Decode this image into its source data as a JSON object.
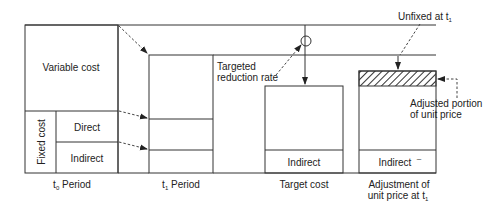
{
  "diagram": {
    "type": "target-costing-flow",
    "columns": [
      {
        "id": "t0",
        "label": "t",
        "sub": "0",
        "label_rest": " Period"
      },
      {
        "id": "t1",
        "label": "t",
        "sub": "1",
        "label_rest": " Period"
      },
      {
        "id": "target",
        "label": "Target cost"
      },
      {
        "id": "adjust",
        "label_line1": "Adjustment of",
        "label_line2": "unit price at t",
        "sub": "1"
      }
    ],
    "t0_box": {
      "variable_cost": "Variable cost",
      "fixed_cost": "Fixed cost",
      "direct": "Direct",
      "indirect": "Indirect"
    },
    "target_box": {
      "indirect": "Indirect"
    },
    "adjust_box": {
      "indirect": "Indirect",
      "mark": "–"
    },
    "annotations": {
      "targeted_reduction_line1": "Targeted",
      "targeted_reduction_line2": "reduction rate",
      "unfixed": "Unfixed at t",
      "unfixed_sub": "1",
      "adjusted_line1": "Adjusted portion",
      "adjusted_line2": "of unit price"
    }
  }
}
